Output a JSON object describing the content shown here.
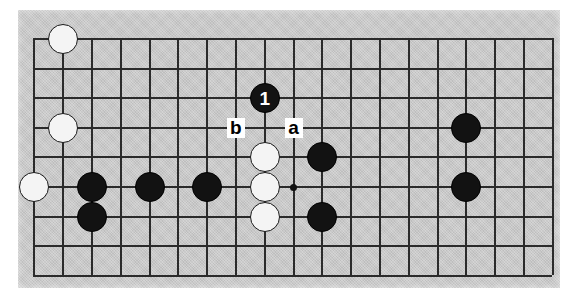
{
  "diagram": {
    "type": "go-board-position",
    "board": {
      "columns": 19,
      "rows": 9,
      "origin_x": 33.3,
      "origin_y": 38.0,
      "col_spacing": 28.8,
      "row_spacing": 29.6,
      "surface_color": "#c8c8c8",
      "line_color": "#2b2b2b",
      "page_background": "#ffffff"
    },
    "star_points": [
      {
        "name": "star-point-center",
        "col": 9,
        "row": 5
      }
    ],
    "stones": [
      {
        "name": "white-stone-c9",
        "color": "white",
        "col": 1,
        "row": 0,
        "number": ""
      },
      {
        "name": "white-stone-c9-lower",
        "color": "white",
        "col": 1,
        "row": 3,
        "number": ""
      },
      {
        "name": "white-stone-left-edge",
        "color": "white",
        "col": 0,
        "row": 5,
        "number": ""
      },
      {
        "name": "black-stone-b2",
        "color": "black",
        "col": 2,
        "row": 5,
        "number": ""
      },
      {
        "name": "black-stone-b3",
        "color": "black",
        "col": 4,
        "row": 5,
        "number": ""
      },
      {
        "name": "black-stone-b4",
        "color": "black",
        "col": 6,
        "row": 5,
        "number": ""
      },
      {
        "name": "black-stone-below-left",
        "color": "black",
        "col": 2,
        "row": 6,
        "number": ""
      },
      {
        "name": "white-stone-wall-top",
        "color": "white",
        "col": 8,
        "row": 4,
        "number": ""
      },
      {
        "name": "white-stone-wall-mid",
        "color": "white",
        "col": 8,
        "row": 5,
        "number": ""
      },
      {
        "name": "white-stone-wall-bottom",
        "color": "white",
        "col": 8,
        "row": 6,
        "number": ""
      },
      {
        "name": "black-stone-right-upper",
        "color": "black",
        "col": 10,
        "row": 4,
        "number": ""
      },
      {
        "name": "black-stone-right-lower",
        "color": "black",
        "col": 10,
        "row": 6,
        "number": ""
      },
      {
        "name": "black-stone-far-right-upper",
        "color": "black",
        "col": 15,
        "row": 3,
        "number": ""
      },
      {
        "name": "black-stone-far-right-lower",
        "color": "black",
        "col": 15,
        "row": 5,
        "number": ""
      },
      {
        "name": "black-move-one",
        "color": "black",
        "col": 8,
        "row": 2,
        "number": "1"
      }
    ],
    "point_labels": [
      {
        "name": "point-label-b",
        "text": "b",
        "col": 7,
        "row": 3
      },
      {
        "name": "point-label-a",
        "text": "a",
        "col": 9,
        "row": 3
      }
    ]
  }
}
